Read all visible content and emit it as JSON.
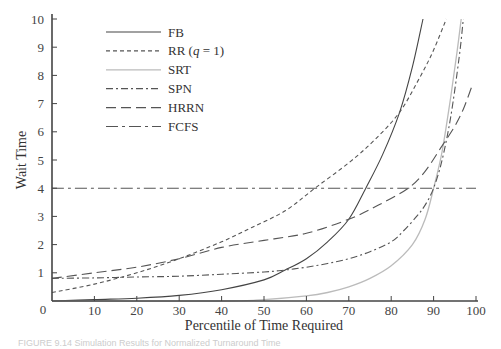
{
  "chart_data": {
    "type": "line",
    "title": "",
    "xlabel": "Percentile of Time Required",
    "ylabel": "Wait Time",
    "xlim": [
      0,
      100
    ],
    "ylim": [
      0,
      10
    ],
    "x_ticks": [
      0,
      10,
      20,
      30,
      40,
      50,
      60,
      70,
      80,
      90,
      100
    ],
    "y_ticks": [
      1,
      2,
      3,
      4,
      5,
      6,
      7,
      8,
      9,
      10
    ],
    "grid": false,
    "legend_position": "upper-left",
    "series": [
      {
        "name": "FB",
        "style": "solid",
        "color": "#444444",
        "x": [
          0,
          10,
          20,
          30,
          40,
          50,
          55,
          60,
          65,
          70,
          74,
          78,
          82,
          85,
          87.5
        ],
        "y": [
          0.0,
          0.05,
          0.1,
          0.2,
          0.4,
          0.75,
          1.1,
          1.5,
          2.1,
          2.9,
          4.0,
          5.2,
          6.7,
          8.3,
          10.0
        ]
      },
      {
        "name": "RR (q = 1)",
        "style": "short-dash",
        "color": "#555555",
        "x": [
          0,
          10,
          20,
          30,
          40,
          47,
          55,
          62,
          70,
          76,
          82,
          87,
          90,
          93
        ],
        "y": [
          0.3,
          0.6,
          1.0,
          1.5,
          2.1,
          2.6,
          3.2,
          4.0,
          4.9,
          5.7,
          6.7,
          8.0,
          8.9,
          10.0
        ]
      },
      {
        "name": "SRT",
        "style": "solid",
        "color": "#bbbbbb",
        "x": [
          0,
          40,
          50,
          60,
          65,
          70,
          75,
          80,
          85,
          88,
          90,
          92,
          94,
          95.5,
          96.5
        ],
        "y": [
          0.0,
          0.0,
          0.05,
          0.18,
          0.3,
          0.5,
          0.8,
          1.25,
          2.0,
          2.9,
          4.0,
          5.3,
          7.2,
          8.8,
          10.0
        ]
      },
      {
        "name": "SPN",
        "style": "dash-dot-short",
        "color": "#555555",
        "x": [
          0,
          10,
          20,
          30,
          40,
          50,
          55,
          60,
          65,
          70,
          75,
          80,
          83,
          86,
          88,
          90,
          92,
          94,
          96,
          97
        ],
        "y": [
          0.8,
          0.82,
          0.85,
          0.88,
          0.95,
          1.03,
          1.1,
          1.2,
          1.33,
          1.5,
          1.75,
          2.1,
          2.5,
          3.0,
          3.4,
          4.0,
          5.0,
          6.5,
          8.6,
          10.0
        ]
      },
      {
        "name": "HRRN",
        "style": "long-dash",
        "color": "#555555",
        "x": [
          0,
          10,
          20,
          30,
          40,
          50,
          60,
          70,
          77,
          84,
          88,
          92,
          95,
          97,
          99
        ],
        "y": [
          0.8,
          1.0,
          1.2,
          1.5,
          1.9,
          2.15,
          2.4,
          2.9,
          3.4,
          4.0,
          4.6,
          5.5,
          6.2,
          6.8,
          7.6
        ]
      },
      {
        "name": "FCFS",
        "style": "dash-dot-long",
        "color": "#555555",
        "x": [
          0,
          100
        ],
        "y": [
          4.0,
          4.0
        ]
      }
    ]
  },
  "legend": {
    "items": [
      {
        "label": "FB",
        "dash": "",
        "color": "#444444"
      },
      {
        "label": "RR (q = 1)",
        "dash": "4 3",
        "color": "#555555"
      },
      {
        "label": "SRT",
        "dash": "",
        "color": "#bbbbbb"
      },
      {
        "label": "SPN",
        "dash": "7 3 2 3",
        "color": "#555555"
      },
      {
        "label": "HRRN",
        "dash": "10 5",
        "color": "#555555"
      },
      {
        "label": "FCFS",
        "dash": "12 4 3 4",
        "color": "#555555"
      }
    ]
  },
  "axes": {
    "x_title": "Percentile of Time Required",
    "y_title": "Wait Time",
    "origin_label": "0"
  },
  "caption": "FIGURE 9.14  Simulation Results for Normalized Turnaround Time"
}
